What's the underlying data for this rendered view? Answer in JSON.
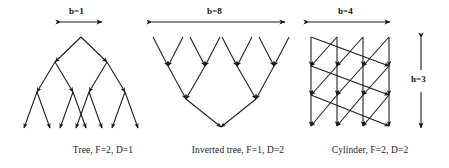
{
  "figure": {
    "type": "diagram",
    "background": "#ffffff",
    "line_color": "#1a1a1a",
    "panels": [
      {
        "id": "tree",
        "caption": "Tree, F=2, D=1",
        "dimension_label": "b=1",
        "dimension_axis": "horizontal",
        "params": {
          "F": 2,
          "D": 1,
          "b": 1
        },
        "levels": 4,
        "nodes_per_level": [
          1,
          2,
          4,
          8
        ],
        "edge_direction": "downward-diverging"
      },
      {
        "id": "inverted-tree",
        "caption": "Inverted tree, F=1, D=2",
        "dimension_label": "b=8",
        "dimension_axis": "horizontal",
        "params": {
          "F": 1,
          "D": 2,
          "b": 8
        },
        "levels": 4,
        "nodes_per_level": [
          8,
          4,
          2,
          1
        ],
        "edge_direction": "downward-converging"
      },
      {
        "id": "cylinder",
        "caption": "Cylinder, F=2, D=2",
        "dimension_label": "b=4",
        "height_label": "h=3",
        "dimension_axis": "horizontal",
        "params": {
          "F": 2,
          "D": 2,
          "b": 4,
          "h": 3
        },
        "grid_columns": 4,
        "grid_rows": 4,
        "edge_direction": "downward-vertical-and-wrapping-diagonal"
      }
    ]
  }
}
